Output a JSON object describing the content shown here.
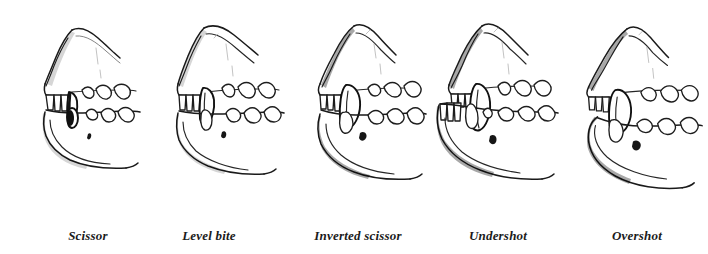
{
  "figure": {
    "background_color": "#ffffff",
    "ink_color": "#1a1a1a",
    "width": 708,
    "height": 254,
    "caption_style": "italic serif"
  },
  "panels": [
    {
      "id": "scissor",
      "label": "Scissor",
      "index": 1,
      "left": 10,
      "caption_left": 38,
      "caption_width": 100,
      "description": "Upper incisors closely overlap the lower incisors; upper canine sits just behind lower canine"
    },
    {
      "id": "level-bite",
      "label": "Level bite",
      "index": 2,
      "left": 148,
      "caption_left": 159,
      "caption_width": 100,
      "description": "Upper and lower incisors meet edge to edge"
    },
    {
      "id": "inverted-scissor",
      "label": "Inverted scissor",
      "index": 3,
      "left": 288,
      "caption_left": 307,
      "caption_width": 102,
      "description": "Lower incisors close just in front of the upper incisors"
    },
    {
      "id": "undershot",
      "label": "Undershot",
      "index": 4,
      "left": 420,
      "caption_left": 448,
      "caption_width": 100,
      "description": "Lower jaw projects forward of the upper jaw"
    },
    {
      "id": "overshot",
      "label": "Overshot",
      "index": 5,
      "left": 556,
      "caption_left": 587,
      "caption_width": 100,
      "description": "Upper jaw projects forward of the lower jaw leaving a gap"
    }
  ]
}
